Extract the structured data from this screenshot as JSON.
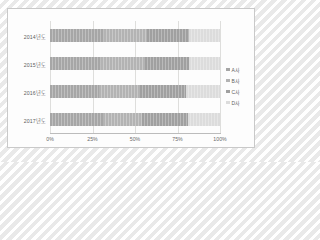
{
  "chart_data": {
    "type": "bar",
    "orientation": "horizontal",
    "stacked": true,
    "normalized": "100%",
    "title": "",
    "subtitle": "",
    "xlabel": "",
    "ylabel": "",
    "categories": [
      "2014년도",
      "2015년도",
      "2016년도",
      "2017년도"
    ],
    "series": [
      {
        "name": "A사",
        "color": "#a6a6a6",
        "values": [
          32,
          30,
          29,
          31
        ]
      },
      {
        "name": "B사",
        "color": "#b3b3b3",
        "values": [
          25,
          26,
          24,
          23
        ]
      },
      {
        "name": "C사",
        "color": "#a0a0a0",
        "values": [
          25,
          26,
          27,
          27
        ]
      },
      {
        "name": "D사",
        "color": "#dcdcdc",
        "values": [
          18,
          18,
          20,
          19
        ]
      }
    ],
    "xticks": [
      "0%",
      "25%",
      "50%",
      "75%",
      "100%"
    ],
    "xtick_values": [
      0,
      25,
      50,
      75,
      100
    ],
    "xlim": [
      0,
      100
    ],
    "grid": true,
    "grid_axis": "x",
    "legend": {
      "position": "right",
      "entries": [
        "A사",
        "B사",
        "C사",
        "D사"
      ]
    }
  },
  "colors": {
    "card_background": "#fdfdfd",
    "card_border": "#c9c9c9",
    "gridline": "#dededc",
    "axis": "#bcbcbc",
    "label_text": "#5d5d5d",
    "tick_text": "#6a6a6a",
    "page_background": "#f2f2f2"
  }
}
